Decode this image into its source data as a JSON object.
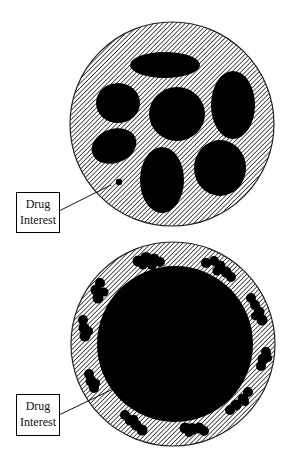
{
  "diagram": {
    "top_particle": {
      "label": {
        "line1": "Drug",
        "line2": "Interest"
      },
      "description": "Hatched circle with several large black ellipses dispersed inside, plus one small dot indicated by the label"
    },
    "bottom_particle": {
      "label": {
        "line1": "Drug",
        "line2": "Interest"
      },
      "description": "Hatched circle with a large solid black core and small black clustered blobs around the hatched rim"
    },
    "colors": {
      "fill": "#000000",
      "hatch": "#000000",
      "background": "#ffffff"
    }
  }
}
